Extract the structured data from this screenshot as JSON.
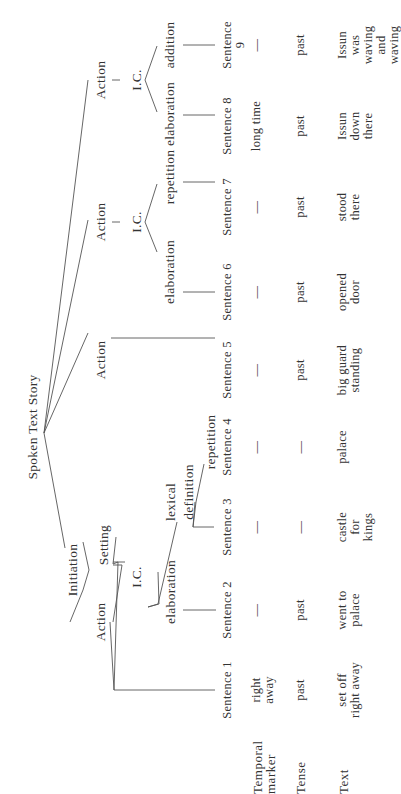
{
  "diagram": {
    "root": "Spoken Text Story",
    "nodes": {
      "initiation": "Initiation",
      "initiation_action": "Action",
      "setting": "Setting",
      "setting_ic": "I.C.",
      "setting_elaboration": "elaboration",
      "lexical_definition_l1": "lexical",
      "lexical_definition_l2": "definition",
      "repetition_s4": "repetition",
      "action_s5": "Action",
      "action_mid": "Action",
      "action_mid_ic": "I.C.",
      "action_mid_elaboration": "elaboration",
      "action_mid_repetition": "repetition",
      "action_top": "Action",
      "action_top_ic": "I.C.",
      "action_top_elaboration": "elaboration",
      "action_top_addition": "addition"
    },
    "dash": "—"
  },
  "table": {
    "row_labels": {
      "temporal_marker": "Temporal\nmarker",
      "tense": "Tense",
      "text": "Text"
    },
    "sentences": [
      {
        "label": "Sentence 1",
        "temporal_marker": "right\naway",
        "tense": "past",
        "text": "set off\nright away"
      },
      {
        "label": "Sentence 2",
        "temporal_marker": "—",
        "tense": "past",
        "text": "went to\npalace"
      },
      {
        "label": "Sentence 3",
        "temporal_marker": "—",
        "tense": "—",
        "text": "castle\nfor\nkings"
      },
      {
        "label": "Sentence 4",
        "temporal_marker": "—",
        "tense": "—",
        "text": "palace"
      },
      {
        "label": "Sentence 5",
        "temporal_marker": "—",
        "tense": "past",
        "text": "big guard\nstanding"
      },
      {
        "label": "Sentence 6",
        "temporal_marker": "—",
        "tense": "past",
        "text": "opened\ndoor"
      },
      {
        "label": "Sentence 7",
        "temporal_marker": "—",
        "tense": "past",
        "text": "stood\nthere"
      },
      {
        "label": "Sentence 8",
        "temporal_marker": "long time",
        "tense": "past",
        "text": "Issun\ndown\nthere"
      },
      {
        "label": "Sentence 9",
        "temporal_marker": "—",
        "tense": "past",
        "text": "Issun was\nwaving and\nwaving"
      }
    ]
  }
}
